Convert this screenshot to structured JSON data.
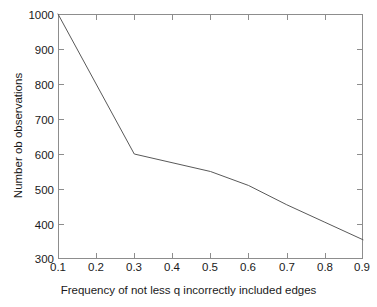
{
  "chart_data": {
    "type": "line",
    "title": "",
    "xlabel": "Frequency of not less q incorrectly included edges",
    "ylabel": "Number ob observations",
    "xlim": [
      0.1,
      0.9
    ],
    "ylim": [
      300,
      1000
    ],
    "grid": false,
    "legend": null,
    "xticks": [
      "0.1",
      "0.2",
      "0.3",
      "0.4",
      "0.5",
      "0.6",
      "0.7",
      "0.8",
      "0.9"
    ],
    "xtick_values": [
      0.1,
      0.2,
      0.3,
      0.4,
      0.5,
      0.6,
      0.7,
      0.8,
      0.9
    ],
    "yticks": [
      "300",
      "400",
      "500",
      "600",
      "700",
      "800",
      "900",
      "1000"
    ],
    "ytick_values": [
      300,
      400,
      500,
      600,
      700,
      800,
      900,
      1000
    ],
    "series": [
      {
        "name": "observations",
        "color": "#595959",
        "x": [
          0.1,
          0.3,
          0.5,
          0.6,
          0.7,
          0.8,
          0.9
        ],
        "values": [
          1000,
          600,
          550,
          510,
          455,
          405,
          355
        ]
      }
    ]
  },
  "axes": {
    "x_title": "Frequency of not less q incorrectly included edges",
    "y_title": "Number ob observations"
  },
  "style": {
    "line_color": "#595959",
    "frame_color": "#8d8d8d",
    "background": "#ffffff",
    "text_color": "#1a1a1a"
  }
}
